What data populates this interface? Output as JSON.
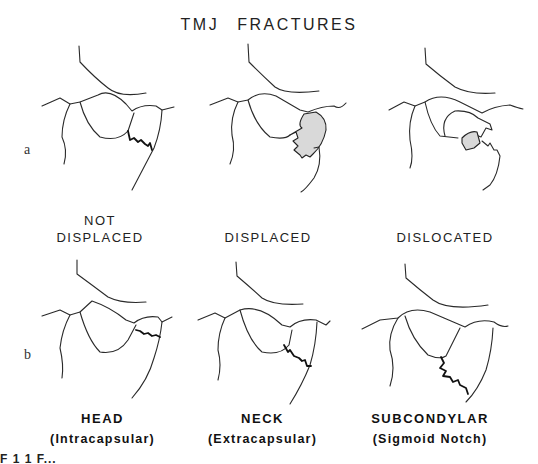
{
  "figure": {
    "title_words": [
      "TMJ",
      "FRACTURES"
    ],
    "row_labels": {
      "a": "a",
      "b": "b"
    },
    "row_a": {
      "captions": [
        {
          "line1": "NOT",
          "line2": "DISPLACED"
        },
        {
          "line1": "",
          "line2": "DISPLACED"
        },
        {
          "line1": "",
          "line2": "DISLOCATED"
        }
      ]
    },
    "row_b": {
      "captions": [
        {
          "main": "HEAD",
          "sub": "(Intracapsular)"
        },
        {
          "main": "NECK",
          "sub": "(Extracapsular)"
        },
        {
          "main": "SUBCONDYLAR",
          "sub": "(Sigmoid Notch)"
        }
      ]
    },
    "cut_off_text": "F 1 1  F..."
  }
}
